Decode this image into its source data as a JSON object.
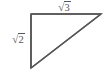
{
  "figure": {
    "kind": "right-triangle-diagram",
    "background_color": "#ffffff",
    "stroke_color": "#565656",
    "label_color": "#565656",
    "stroke_width": 1.5,
    "right_angle_vertex": "top-left",
    "vertices": {
      "top_left": {
        "x": 31,
        "y": 14
      },
      "top_right": {
        "x": 101,
        "y": 14
      },
      "bottom_left": {
        "x": 31,
        "y": 68
      }
    },
    "labels": {
      "top_leg": {
        "text": "√3",
        "radical_sign": "√",
        "radicand": "3",
        "position": "above-horizontal-leg"
      },
      "left_leg": {
        "text": "√2",
        "radical_sign": "√",
        "radicand": "2",
        "position": "left-of-vertical-leg"
      }
    }
  }
}
